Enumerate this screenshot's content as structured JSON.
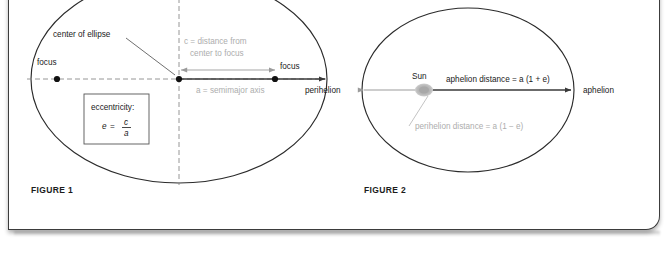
{
  "figure1": {
    "caption": "FIGURE 1",
    "labels": {
      "center_of_ellipse": "center of ellipse",
      "focus_left": "focus",
      "focus_right": "focus",
      "c_distance_line1": "c = distance from",
      "c_distance_line2": "center to focus",
      "semimajor": "a = semimajor axis"
    },
    "eccentricity_box": {
      "title": "eccentricity:",
      "lhs": "e",
      "equals": "=",
      "numerator": "c",
      "denominator": "a"
    }
  },
  "figure2": {
    "caption": "FIGURE 2",
    "labels": {
      "sun": "Sun",
      "perihelion": "perihelion",
      "aphelion": "aphelion",
      "aphelion_distance": "aphelion distance = a (1 + e)",
      "perihelion_distance": "perihelion distance = a (1 − e)"
    }
  },
  "colors": {
    "ink": "#1a1a1a",
    "gray_label": "#adadad",
    "ellipse_stroke": "#2b2b2b",
    "axis_dash": "#8a8a8a",
    "arrow_dark": "#3a3a3a",
    "arrow_gray": "#9b9b9b",
    "sun_fill": "#b0b0b0",
    "card_border": "#3c3c3c",
    "background": "#ffffff"
  }
}
